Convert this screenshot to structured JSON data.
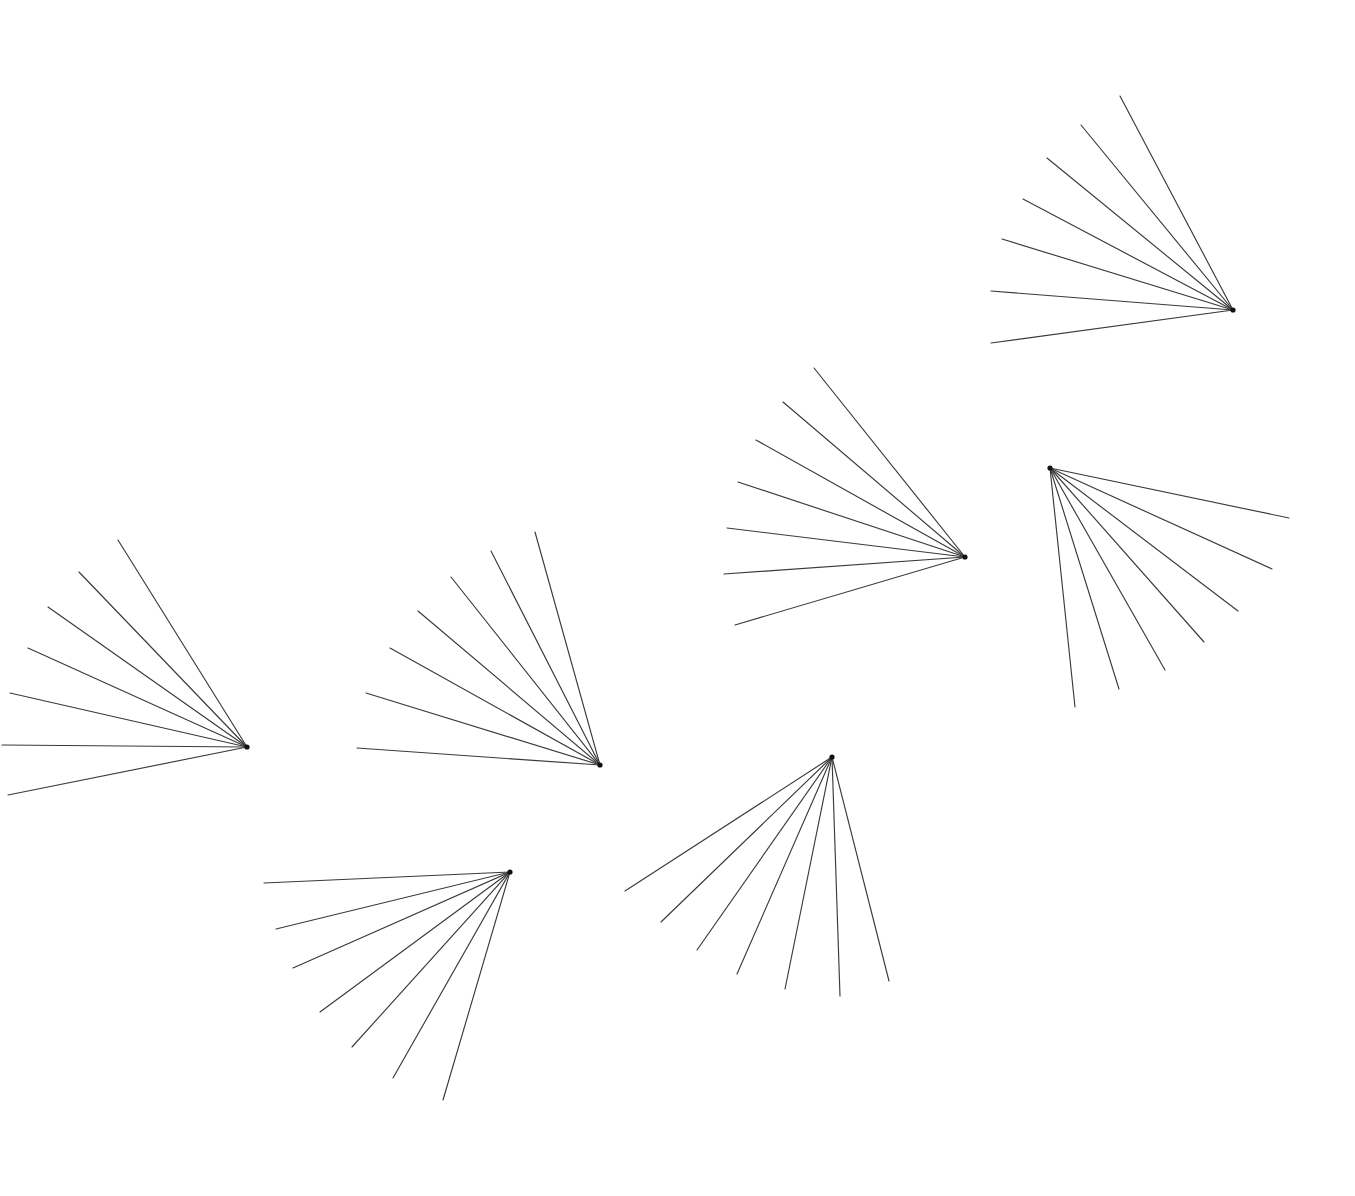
{
  "figure": {
    "background_color": "#ffffff",
    "stroke_color": "#3a3a3a",
    "vertex_color": "#111111",
    "stroke_width": 1.15,
    "width": 1355,
    "height": 1196,
    "shape_count": 7,
    "rays_per_shape": 7
  },
  "chart_data": {
    "type": "scatter",
    "subtitle": "",
    "xlabel": "",
    "ylabel": "",
    "xlim": [
      0,
      1355
    ],
    "ylim": [
      0,
      1196
    ],
    "grid": false,
    "legend": "none",
    "annotations": [],
    "series": [
      {
        "name": "fan-1",
        "vertex": [
          247,
          747
        ],
        "ray_count": 7,
        "rays": [
          {
            "index": 0,
            "end": [
              118,
              540
            ],
            "angle_deg": 238.1,
            "length": 243.0
          },
          {
            "index": 1,
            "end": [
              79,
              572
            ],
            "angle_deg": 229.5,
            "length": 224.5
          },
          {
            "index": 2,
            "end": [
              48,
              607
            ],
            "angle_deg": 215.3,
            "length": 243.3
          },
          {
            "index": 3,
            "end": [
              28,
              648
            ],
            "angle_deg": 204.2,
            "length": 240.4
          },
          {
            "index": 4,
            "end": [
              10,
              693
            ],
            "angle_deg": 193.5,
            "length": 243.7
          },
          {
            "index": 5,
            "end": [
              2,
              745
            ],
            "angle_deg": 180.5,
            "length": 245.0
          },
          {
            "index": 6,
            "end": [
              8,
              795
            ],
            "angle_deg": 168.0,
            "length": 244.0
          }
        ]
      },
      {
        "name": "fan-2",
        "vertex": [
          600,
          765
        ],
        "ray_count": 7,
        "rays": [
          {
            "index": 0,
            "end": [
              535,
              532
            ],
            "angle_deg": 254.4,
            "length": 241.9
          },
          {
            "index": 1,
            "end": [
              491,
              551
            ],
            "angle_deg": 243.0,
            "length": 240.2
          },
          {
            "index": 2,
            "end": [
              451,
              577
            ],
            "angle_deg": 231.6,
            "length": 239.4
          },
          {
            "index": 3,
            "end": [
              418,
              611
            ],
            "angle_deg": 220.3,
            "length": 238.5
          },
          {
            "index": 4,
            "end": [
              390,
              648
            ],
            "angle_deg": 209.1,
            "length": 240.5
          },
          {
            "index": 5,
            "end": [
              366,
              693
            ],
            "angle_deg": 197.1,
            "length": 244.8
          },
          {
            "index": 6,
            "end": [
              357,
              748
            ],
            "angle_deg": 184.0,
            "length": 243.6
          }
        ]
      },
      {
        "name": "fan-3",
        "vertex": [
          965,
          557
        ],
        "ray_count": 7,
        "rays": [
          {
            "index": 0,
            "end": [
              814,
              368
            ],
            "angle_deg": 231.4,
            "length": 241.6
          },
          {
            "index": 1,
            "end": [
              783,
              402
            ],
            "angle_deg": 220.5,
            "length": 239.2
          },
          {
            "index": 2,
            "end": [
              756,
              440
            ],
            "angle_deg": 209.2,
            "length": 239.6
          },
          {
            "index": 3,
            "end": [
              738,
              482
            ],
            "angle_deg": 198.3,
            "length": 239.0
          },
          {
            "index": 4,
            "end": [
              727,
              528
            ],
            "angle_deg": 186.9,
            "length": 239.8
          },
          {
            "index": 5,
            "end": [
              724,
              574
            ],
            "angle_deg": 175.9,
            "length": 241.6
          },
          {
            "index": 6,
            "end": [
              735,
              625
            ],
            "angle_deg": 163.5,
            "length": 239.8
          }
        ]
      },
      {
        "name": "fan-4",
        "vertex": [
          1233,
          310
        ],
        "ray_count": 7,
        "rays": [
          {
            "index": 0,
            "end": [
              1120,
              96
            ],
            "angle_deg": 242.2,
            "length": 242.0
          },
          {
            "index": 1,
            "end": [
              1081,
              125
            ],
            "angle_deg": 230.6,
            "length": 239.0
          },
          {
            "index": 2,
            "end": [
              1047,
              158
            ],
            "angle_deg": 219.3,
            "length": 240.1
          },
          {
            "index": 3,
            "end": [
              1023,
              199
            ],
            "angle_deg": 207.9,
            "length": 237.5
          },
          {
            "index": 4,
            "end": [
              1002,
              239
            ],
            "angle_deg": 197.0,
            "length": 241.7
          },
          {
            "index": 5,
            "end": [
              991,
              291
            ],
            "angle_deg": 184.5,
            "length": 242.7
          },
          {
            "index": 6,
            "end": [
              991,
              343
            ],
            "angle_deg": 172.2,
            "length": 244.2
          }
        ]
      },
      {
        "name": "fan-5",
        "vertex": [
          1050,
          468
        ],
        "ray_count": 7,
        "rays": [
          {
            "index": 0,
            "end": [
              1289,
              518
            ],
            "angle_deg": 11.8,
            "length": 244.2
          },
          {
            "index": 1,
            "end": [
              1272,
              569
            ],
            "angle_deg": 24.5,
            "length": 243.9
          },
          {
            "index": 2,
            "end": [
              1238,
              611
            ],
            "angle_deg": 37.3,
            "length": 236.3
          },
          {
            "index": 3,
            "end": [
              1204,
              642
            ],
            "angle_deg": 48.5,
            "length": 232.4
          },
          {
            "index": 4,
            "end": [
              1165,
              670
            ],
            "angle_deg": 60.4,
            "length": 232.4
          },
          {
            "index": 5,
            "end": [
              1119,
              689
            ],
            "angle_deg": 72.6,
            "length": 231.5
          },
          {
            "index": 6,
            "end": [
              1075,
              707
            ],
            "angle_deg": 84.0,
            "length": 240.3
          }
        ]
      },
      {
        "name": "fan-6",
        "vertex": [
          510,
          872
        ],
        "ray_count": 7,
        "rays": [
          {
            "index": 0,
            "end": [
              264,
              883
            ],
            "angle_deg": 177.4,
            "length": 246.2
          },
          {
            "index": 1,
            "end": [
              276,
              929
            ],
            "angle_deg": 166.4,
            "length": 240.8
          },
          {
            "index": 2,
            "end": [
              293,
              968
            ],
            "angle_deg": 156.1,
            "length": 237.3
          },
          {
            "index": 3,
            "end": [
              320,
              1012
            ],
            "angle_deg": 143.6,
            "length": 236.4
          },
          {
            "index": 4,
            "end": [
              352,
              1047
            ],
            "angle_deg": 132.1,
            "length": 235.5
          },
          {
            "index": 5,
            "end": [
              393,
              1078
            ],
            "angle_deg": 119.5,
            "length": 236.5
          },
          {
            "index": 6,
            "end": [
              443,
              1100
            ],
            "angle_deg": 106.4,
            "length": 237.6
          }
        ]
      },
      {
        "name": "fan-7",
        "vertex": [
          832,
          757
        ],
        "ray_count": 7,
        "rays": [
          {
            "index": 0,
            "end": [
              625,
              891
            ],
            "angle_deg": 147.1,
            "length": 246.6
          },
          {
            "index": 1,
            "end": [
              661,
              922
            ],
            "angle_deg": 136.0,
            "length": 237.2
          },
          {
            "index": 2,
            "end": [
              697,
              950
            ],
            "angle_deg": 125.0,
            "length": 235.6
          },
          {
            "index": 3,
            "end": [
              737,
              974
            ],
            "angle_deg": 113.6,
            "length": 237.0
          },
          {
            "index": 4,
            "end": [
              785,
              989
            ],
            "angle_deg": 101.5,
            "length": 236.7
          },
          {
            "index": 5,
            "end": [
              840,
              996
            ],
            "angle_deg": 88.1,
            "length": 239.1
          },
          {
            "index": 6,
            "end": [
              889,
              981
            ],
            "angle_deg": 75.7,
            "length": 231.1
          }
        ]
      }
    ]
  }
}
